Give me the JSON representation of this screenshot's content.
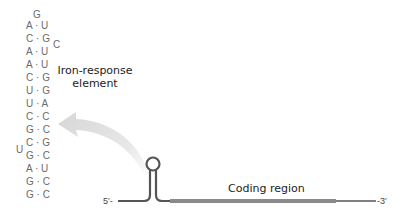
{
  "ire": {
    "loop_top": "G",
    "bulge_c": "C",
    "bulge_u": "U",
    "pairs": [
      {
        "left": "A",
        "sep": "·",
        "right": "U"
      },
      {
        "left": "C",
        "sep": "·",
        "right": "G"
      },
      {
        "left": "A",
        "sep": "·",
        "right": "U"
      },
      {
        "left": "A",
        "sep": "·",
        "right": "U"
      },
      {
        "left": "C",
        "sep": "·",
        "right": "G"
      },
      {
        "left": "U",
        "sep": "·",
        "right": "G"
      },
      {
        "left": "U",
        "sep": "·",
        "right": "A"
      },
      {
        "left": "C",
        "sep": "·",
        "right": "C"
      },
      {
        "left": "G",
        "sep": "·",
        "right": "C"
      },
      {
        "left": "C",
        "sep": "·",
        "right": "G"
      },
      {
        "left": "G",
        "sep": "·",
        "right": "C"
      },
      {
        "left": "A",
        "sep": "·",
        "right": "U"
      },
      {
        "left": "G",
        "sep": "·",
        "right": "C"
      },
      {
        "left": "G",
        "sep": "·",
        "right": "C"
      }
    ],
    "label_line1": "Iron-response",
    "label_line2": "element"
  },
  "mrna": {
    "five_prime": "5′-",
    "three_prime": "-3′",
    "coding_label": "Coding region"
  },
  "colors": {
    "strand": "#555555",
    "coding": "#8a8a8a",
    "arrow": "#dcdcdc",
    "text": "#6b6b6b"
  }
}
